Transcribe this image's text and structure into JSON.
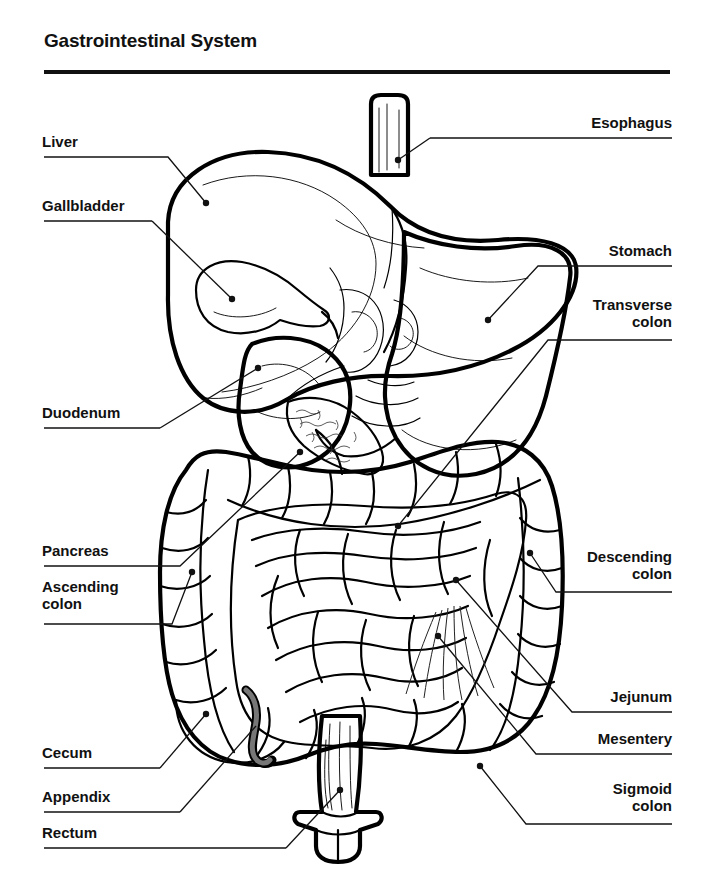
{
  "header": {
    "title": "Gastrointestinal System"
  },
  "labels_left": [
    {
      "id": "liver",
      "text": "Liver",
      "line2": ""
    },
    {
      "id": "gallbladder",
      "text": "Gallbladder",
      "line2": ""
    },
    {
      "id": "duodenum",
      "text": "Duodenum",
      "line2": ""
    },
    {
      "id": "pancreas",
      "text": "Pancreas",
      "line2": ""
    },
    {
      "id": "ascending-colon",
      "text": "Ascending",
      "line2": "colon"
    },
    {
      "id": "cecum",
      "text": "Cecum",
      "line2": ""
    },
    {
      "id": "appendix",
      "text": "Appendix",
      "line2": ""
    },
    {
      "id": "rectum",
      "text": "Rectum",
      "line2": ""
    }
  ],
  "labels_right": [
    {
      "id": "esophagus",
      "text": "Esophagus",
      "line2": ""
    },
    {
      "id": "stomach",
      "text": "Stomach",
      "line2": ""
    },
    {
      "id": "transverse-colon",
      "text": "Transverse",
      "line2": "colon"
    },
    {
      "id": "descending-colon",
      "text": "Descending",
      "line2": "colon"
    },
    {
      "id": "jejunum",
      "text": "Jejunum",
      "line2": ""
    },
    {
      "id": "mesentery",
      "text": "Mesentery",
      "line2": ""
    },
    {
      "id": "sigmoid-colon",
      "text": "Sigmoid",
      "line2": "colon"
    }
  ],
  "colors": {
    "ink": "#111111",
    "liver_fill": "#e3e3e3",
    "gallbladder_fill": "#9e9e9e",
    "stomach_fill": "#e8e8e8",
    "colon_fill": "#efefef",
    "small_intestine_fill": "#d4d4d4",
    "pancreas_fill": "#f2f2f2",
    "background": "#ffffff"
  },
  "figure": {
    "kind": "anatomical-illustration",
    "organ_count": 15
  }
}
